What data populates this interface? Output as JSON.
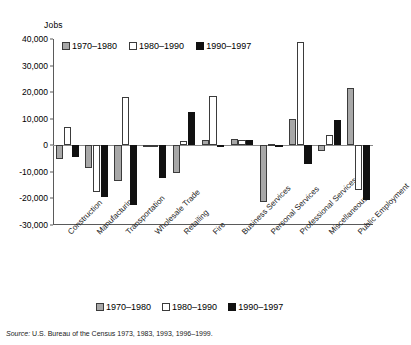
{
  "chart_data": {
    "type": "bar",
    "title": "",
    "subtitle": "",
    "xlabel": "",
    "ylabel": "Jobs",
    "ylim": [
      -30000,
      40000
    ],
    "ytick_step": 10000,
    "ytick_labels": [
      "40,000",
      "30,000",
      "20,000",
      "10,000",
      "0",
      "-10,000",
      "-20,000",
      "-30,000"
    ],
    "ytick_values": [
      40000,
      30000,
      20000,
      10000,
      0,
      -10000,
      -20000,
      -30000
    ],
    "grid": false,
    "legend_position": "top-inside and bottom-outside",
    "categories": [
      "Construction",
      "Manufacturing",
      "Transportation",
      "Wholesale Trade",
      "Retailing",
      "Fire",
      "Business Services",
      "Personal Services",
      "Professional Services",
      "Miscellaneous",
      "Public Employment"
    ],
    "series": [
      {
        "name": "1970–1980",
        "color": "#a8a8a8",
        "values": [
          -5000,
          -8500,
          -13500,
          -500,
          -10500,
          2000,
          2500,
          -21500,
          10000,
          -2000,
          21500
        ]
      },
      {
        "name": "1980–1990",
        "color": "#ffffff",
        "values": [
          7000,
          -17500,
          18000,
          -500,
          1500,
          18500,
          2000,
          500,
          39000,
          4000,
          -17000
        ]
      },
      {
        "name": "1990–1997",
        "color": "#111111",
        "values": [
          -4500,
          -19500,
          -22500,
          -12500,
          12500,
          -500,
          2000,
          0,
          -7000,
          9500,
          -20500
        ]
      }
    ],
    "source": {
      "prefix": "Source:",
      "text": "U.S. Bureau of the Census 1973, 1983, 1993, 1996–1999."
    }
  }
}
